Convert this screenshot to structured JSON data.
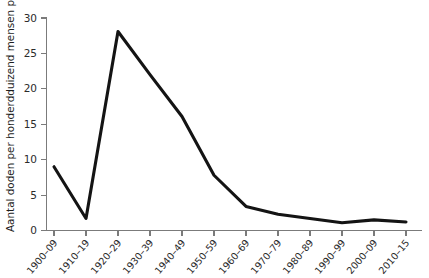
{
  "chart_data": {
    "type": "line",
    "title": "",
    "subtitle": "",
    "xlabel": "",
    "ylabel": "Aantal doden per honderdduizend mensen per jaar",
    "categories": [
      "1900–09",
      "1910–19",
      "1920–29",
      "1930–39",
      "1940–49",
      "1950–59",
      "1960–69",
      "1970–79",
      "1980–89",
      "1990–99",
      "2000–09",
      "2010–15"
    ],
    "values": [
      9.0,
      1.7,
      28.1,
      22.0,
      16.1,
      7.8,
      3.4,
      2.3,
      1.7,
      1.1,
      1.5,
      1.2
    ],
    "series": [
      {
        "name": "Aantal doden per honderdduizend mensen per jaar",
        "values": [
          9.0,
          1.7,
          28.1,
          22.0,
          16.1,
          7.8,
          3.4,
          2.3,
          1.7,
          1.1,
          1.5,
          1.2
        ]
      }
    ],
    "ylim": [
      0,
      30
    ],
    "yticks": [
      0,
      5,
      10,
      15,
      20,
      25,
      30
    ],
    "ytick_labels": [
      "0",
      "5",
      "10",
      "15",
      "20",
      "25",
      "30"
    ],
    "grid": false,
    "legend": "none",
    "line_color": "#141414",
    "axis_color": "#7b7b7b",
    "background_color": "#ffffff"
  },
  "axes": {
    "y_title": "Aantal doden per honderdduizend mensen per jaar",
    "x_title": ""
  }
}
